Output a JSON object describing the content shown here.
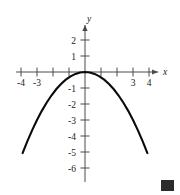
{
  "figure": {
    "name": "parabola-graph",
    "background_color": "#ffffff",
    "curve_color": "#0a0a0a",
    "axis_color": "#4a4a4a",
    "marker_color": "#2b2b2b"
  },
  "chart_data": {
    "type": "line",
    "title": "",
    "subtitle": "",
    "xlabel": "x",
    "ylabel": "y",
    "xlim": [
      -4.8,
      4.8
    ],
    "ylim": [
      -6.4,
      2.4
    ],
    "grid": false,
    "legend": null,
    "x_ticks": [
      -4,
      -3,
      -2,
      -1,
      1,
      2,
      3,
      4
    ],
    "x_tick_labels": [
      "-4",
      "-3",
      "",
      "",
      "",
      "",
      "3",
      "4"
    ],
    "y_ticks": [
      2,
      1,
      -1,
      -2,
      -3,
      -4,
      -5,
      -6
    ],
    "y_tick_labels": [
      "2",
      "1",
      "-1",
      "-2",
      "-3",
      "-4",
      "-5",
      "-6"
    ],
    "series": [
      {
        "name": "y = -x^2/3",
        "x": [
          -3.9,
          -3.6,
          -3.3,
          -3.0,
          -2.7,
          -2.4,
          -2.1,
          -1.8,
          -1.5,
          -1.2,
          -0.9,
          -0.6,
          -0.3,
          0.0,
          0.3,
          0.6,
          0.9,
          1.2,
          1.5,
          1.8,
          2.1,
          2.4,
          2.7,
          3.0,
          3.3,
          3.6,
          3.9
        ],
        "values": [
          -5.07,
          -4.32,
          -3.63,
          -3.0,
          -2.43,
          -1.92,
          -1.47,
          -1.08,
          -0.75,
          -0.48,
          -0.27,
          -0.12,
          -0.03,
          0.0,
          -0.03,
          -0.12,
          -0.27,
          -0.48,
          -0.75,
          -1.08,
          -1.47,
          -1.92,
          -2.43,
          -3.0,
          -3.63,
          -4.32,
          -5.07
        ]
      }
    ],
    "annotations": [],
    "vertex": [
      0,
      0
    ]
  },
  "labels": {
    "x_axis": "x",
    "y_axis": "y",
    "xm4": "-4",
    "xm3": "-3",
    "x3": "3",
    "x4": "4",
    "y2": "2",
    "y1": "1",
    "ym1": "-1",
    "ym2": "-2",
    "ym3": "-3",
    "ym4": "-4",
    "ym5": "-5",
    "ym6": "-6"
  }
}
